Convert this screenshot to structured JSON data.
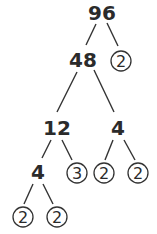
{
  "diagram": {
    "type": "factor-tree",
    "root": "96",
    "nodes": {
      "n96": "96",
      "n48": "48",
      "n2a": "2",
      "n12": "12",
      "n4r": "4",
      "n4l": "4",
      "n3": "3",
      "n2b": "2",
      "n2c": "2",
      "n2d": "2",
      "n2e": "2"
    },
    "edges": [
      [
        "96",
        "48"
      ],
      [
        "96",
        "2"
      ],
      [
        "48",
        "12"
      ],
      [
        "48",
        "4"
      ],
      [
        "12",
        "4"
      ],
      [
        "12",
        "3"
      ],
      [
        "4",
        "2"
      ],
      [
        "4",
        "2"
      ],
      [
        "4",
        "2"
      ],
      [
        "4",
        "2"
      ]
    ],
    "prime_leaves": [
      "2",
      "3",
      "2",
      "2",
      "2",
      "2"
    ],
    "colors": {
      "ink": "#2b2b2b",
      "background": "#ffffff"
    }
  }
}
